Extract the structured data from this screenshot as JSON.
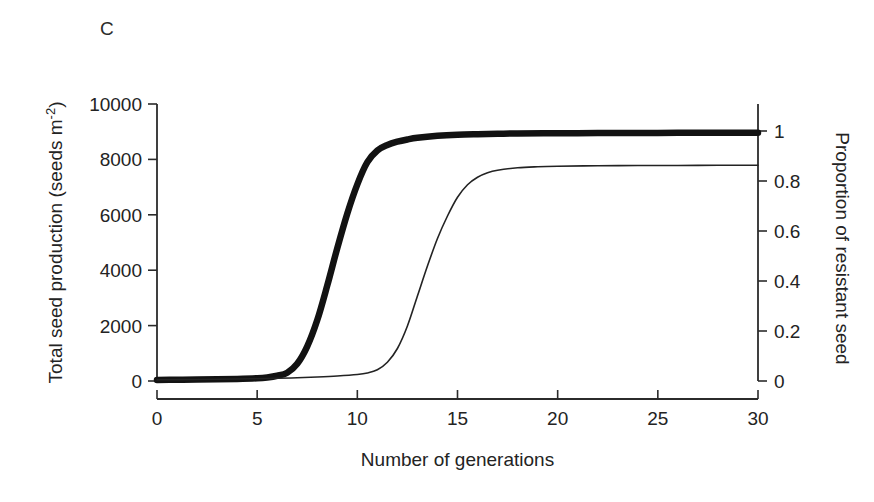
{
  "figure": {
    "panel_label": "C",
    "background_color": "#ffffff"
  },
  "chart_data": {
    "type": "line",
    "title": "",
    "panel": "C",
    "xlabel": "Number of generations",
    "ylabel": "Total seed production (seeds m-2)",
    "ylabel_main": "Total seed production (seeds m",
    "ylabel_sup": "-2",
    "ylabel_close": ")",
    "y2label": "Proportion of resistant seed",
    "xlim": [
      0,
      30
    ],
    "ylim": [
      0,
      10000
    ],
    "y2lim": [
      0,
      1
    ],
    "xticks": [
      0,
      5,
      10,
      15,
      20,
      25,
      30
    ],
    "xticklabels": [
      "0",
      "5",
      "10",
      "15",
      "20",
      "25",
      "30"
    ],
    "yticks": [
      0,
      2000,
      4000,
      6000,
      8000,
      10000
    ],
    "yticklabels": [
      "0",
      "2000",
      "4000",
      "6000",
      "8000",
      "10000"
    ],
    "y2ticks": [
      0,
      0.2,
      0.4,
      0.6,
      0.8,
      1
    ],
    "y2ticklabels": [
      "0",
      "0.2",
      "0.4",
      "0.6",
      "0.8",
      "1"
    ],
    "grid": false,
    "legend": "none",
    "line_colors": {
      "total_seed_production": "#121212",
      "proportion_resistant_seed": "#232323"
    },
    "series": [
      {
        "name": "Total seed production",
        "axis": "left",
        "style": "thick",
        "color": "#121212",
        "x": [
          0,
          1,
          2,
          3,
          4,
          5,
          5.5,
          6,
          6.5,
          7,
          7.5,
          8,
          8.5,
          9,
          9.5,
          10,
          10.5,
          11,
          11.5,
          12,
          12.5,
          13,
          14,
          15,
          16,
          17,
          18,
          20,
          22,
          24,
          26,
          28,
          30
        ],
        "y": [
          40,
          45,
          50,
          60,
          75,
          100,
          130,
          190,
          300,
          620,
          1250,
          2200,
          3450,
          4800,
          6050,
          7100,
          7900,
          8320,
          8520,
          8640,
          8720,
          8780,
          8850,
          8890,
          8910,
          8925,
          8935,
          8945,
          8950,
          8955,
          8958,
          8960,
          8960
        ]
      },
      {
        "name": "Proportion of resistant seed",
        "axis": "right",
        "style": "thin",
        "color": "#232323",
        "x": [
          0,
          2,
          4,
          6,
          7,
          8,
          9,
          10,
          10.5,
          11,
          11.5,
          12,
          12.5,
          13,
          13.5,
          14,
          14.5,
          15,
          15.5,
          16,
          16.5,
          17,
          18,
          19,
          20,
          22,
          24,
          26,
          28,
          30
        ],
        "y": [
          0.005,
          0.006,
          0.008,
          0.011,
          0.013,
          0.016,
          0.02,
          0.026,
          0.032,
          0.045,
          0.075,
          0.13,
          0.22,
          0.34,
          0.46,
          0.57,
          0.66,
          0.735,
          0.785,
          0.815,
          0.833,
          0.843,
          0.853,
          0.857,
          0.859,
          0.861,
          0.862,
          0.862,
          0.863,
          0.863
        ]
      }
    ]
  }
}
